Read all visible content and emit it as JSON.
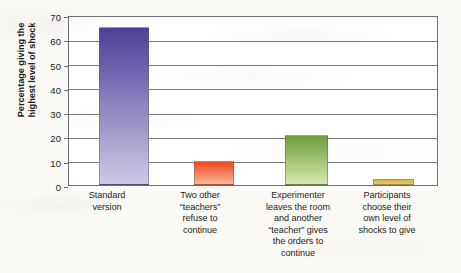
{
  "chart_data": {
    "type": "bar",
    "title": "",
    "subtitle": "",
    "xlabel": "",
    "ylabel": "Percentage giving the\nhighest level of shock",
    "ylabel_line1": "Percentage giving the",
    "ylabel_line2": "highest level of shock",
    "ylim": [
      0,
      70
    ],
    "ytick_values": [
      0,
      10,
      20,
      30,
      40,
      50,
      60,
      70
    ],
    "ytick_labels": [
      "0",
      "10",
      "20",
      "30",
      "40",
      "50",
      "60",
      "70"
    ],
    "grid": "horizontal",
    "legend": "none",
    "categories": [
      "Standard version",
      "Two other “teachers” refuse to continue",
      "Experimenter leaves the room and another “teacher” gives the orders to continue",
      "Participants choose their own level of shocks to give"
    ],
    "category_label_lines": [
      [
        "Standard",
        "version"
      ],
      [
        "Two other",
        "“teachers”",
        "refuse to",
        "continue"
      ],
      [
        "Experimenter",
        "leaves the room",
        "and another",
        "“teacher” gives",
        "the orders to",
        "continue"
      ],
      [
        "Participants",
        "choose their",
        "own level of",
        "shocks to give"
      ]
    ],
    "values": [
      65,
      10,
      20.5,
      2.5
    ],
    "bar_colors_top": [
      "#4c3f99",
      "#f0491f",
      "#6fa03a",
      "#d8b23c"
    ],
    "bar_colors_bottom": [
      "#cfc9e6",
      "#fcb39a",
      "#d6e8ae",
      "#e6cd72"
    ],
    "axis_color": "#6f6f72",
    "text_color": "#1c1c1c",
    "plot_background": "#ffffff",
    "page_background": "#fbfaf7"
  }
}
